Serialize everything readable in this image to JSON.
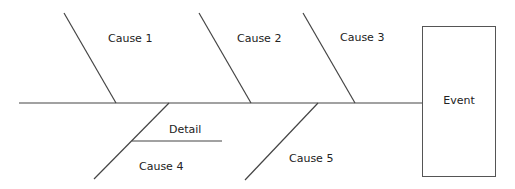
{
  "diagram": {
    "type": "fishbone",
    "event": "Event",
    "causes": [
      {
        "label": "Cause 1",
        "side": "top"
      },
      {
        "label": "Cause 2",
        "side": "top"
      },
      {
        "label": "Cause 3",
        "side": "top"
      },
      {
        "label": "Cause 4",
        "side": "bottom",
        "details": [
          "Detail"
        ]
      },
      {
        "label": "Cause 5",
        "side": "bottom"
      }
    ],
    "line_color": "#444444"
  }
}
